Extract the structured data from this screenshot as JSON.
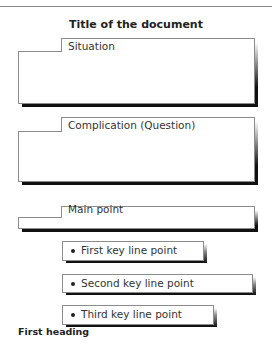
{
  "document": {
    "title": "Title of the document",
    "sections": [
      {
        "label": "Situation"
      },
      {
        "label": "Complication (Question)"
      },
      {
        "label": "Main point"
      }
    ],
    "key_line_points": [
      {
        "label": "First key line point",
        "bullet_icon": "bullet-icon"
      },
      {
        "label": "Second key line point",
        "bullet_icon": "bullet-icon"
      },
      {
        "label": "Third key line point",
        "bullet_icon": "bullet-icon"
      }
    ],
    "first_heading": "First heading"
  },
  "colors": {
    "border": "#8c8c8c",
    "shadow": "#111111",
    "text": "#333333"
  }
}
